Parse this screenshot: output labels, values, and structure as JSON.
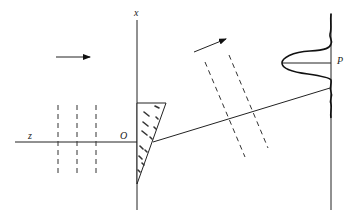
{
  "diagram": {
    "labels": {
      "x_axis": "x",
      "z_axis": "z",
      "origin": "O",
      "point": "P"
    },
    "incident_wavefront_count": 3,
    "deflected_wavefront_count": 2,
    "elements": [
      "incident-plane-wave",
      "wedge-prism",
      "deflected-ray",
      "observation-screen",
      "intensity-pattern"
    ]
  }
}
